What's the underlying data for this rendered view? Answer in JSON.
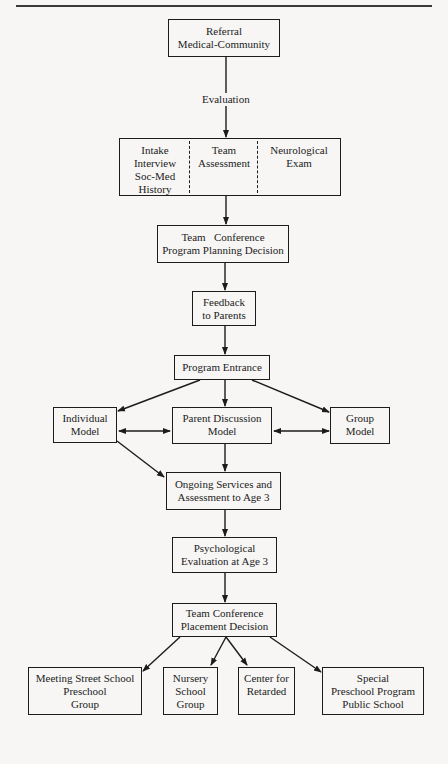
{
  "diagram": {
    "type": "flowchart",
    "nodes": {
      "referral": {
        "lines": [
          "Referral",
          "Medical-Community"
        ]
      },
      "evaluation_label": "Evaluation",
      "evaluation": {
        "cells": [
          {
            "lines": [
              "Intake",
              "Interview",
              "Soc-Med",
              "History"
            ]
          },
          {
            "lines": [
              "Team",
              "Assessment"
            ]
          },
          {
            "lines": [
              "Neurological",
              "Exam"
            ]
          }
        ]
      },
      "team_conference_planning": {
        "lines": [
          "Team   Conference",
          "Program Planning Decision"
        ]
      },
      "feedback": {
        "lines": [
          "Feedback",
          "to Parents"
        ]
      },
      "program_entrance": {
        "lines": [
          "Program Entrance"
        ]
      },
      "individual_model": {
        "lines": [
          "Individual",
          "Model"
        ]
      },
      "parent_discussion_model": {
        "lines": [
          "Parent Discussion",
          "Model"
        ]
      },
      "group_model": {
        "lines": [
          "Group",
          "Model"
        ]
      },
      "ongoing_services": {
        "lines": [
          "Ongoing Services and",
          "Assessment to Age 3"
        ]
      },
      "psychological_evaluation": {
        "lines": [
          "Psychological",
          "Evaluation at Age 3"
        ]
      },
      "team_conference_placement": {
        "lines": [
          "Team Conference",
          "Placement Decision"
        ]
      },
      "meeting_street": {
        "lines": [
          "Meeting Street School",
          "Preschool",
          "Group"
        ]
      },
      "nursery_school": {
        "lines": [
          "Nursery",
          "School",
          "Group"
        ]
      },
      "center_retarded": {
        "lines": [
          "Center for",
          "Retarded"
        ]
      },
      "special_preschool": {
        "lines": [
          "Special",
          "Preschool Program",
          "Public School"
        ]
      }
    },
    "edges": [
      {
        "from": "Referral Medical-Community",
        "to": "Evaluation box",
        "label": "Evaluation"
      },
      {
        "from": "Evaluation box",
        "to": "Team Conference Program Planning Decision"
      },
      {
        "from": "Team Conference Program Planning Decision",
        "to": "Feedback to Parents"
      },
      {
        "from": "Feedback to Parents",
        "to": "Program Entrance"
      },
      {
        "from": "Program Entrance",
        "to": "Individual Model"
      },
      {
        "from": "Program Entrance",
        "to": "Parent Discussion Model"
      },
      {
        "from": "Program Entrance",
        "to": "Group Model"
      },
      {
        "from": "Individual Model",
        "to": "Parent Discussion Model",
        "bidirectional": true
      },
      {
        "from": "Parent Discussion Model",
        "to": "Group Model",
        "bidirectional": true
      },
      {
        "from": "Individual Model",
        "to": "Ongoing Services and Assessment to Age 3"
      },
      {
        "from": "Parent Discussion Model",
        "to": "Ongoing Services and Assessment to Age 3"
      },
      {
        "from": "Ongoing Services and Assessment to Age 3",
        "to": "Psychological Evaluation at Age 3"
      },
      {
        "from": "Psychological Evaluation at Age 3",
        "to": "Team Conference Placement Decision"
      },
      {
        "from": "Team Conference Placement Decision",
        "to": "Meeting Street School Preschool Group"
      },
      {
        "from": "Team Conference Placement Decision",
        "to": "Nursery School Group"
      },
      {
        "from": "Team Conference Placement Decision",
        "to": "Center for Retarded"
      },
      {
        "from": "Team Conference Placement Decision",
        "to": "Special Preschool Program Public School"
      }
    ]
  }
}
